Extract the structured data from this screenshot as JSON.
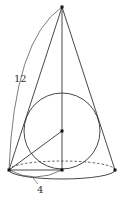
{
  "figure": {
    "labels": {
      "slant_height": "12",
      "base_radius": "4"
    },
    "colors": {
      "stroke": "#333333",
      "point": "#111111",
      "background": "#ffffff"
    }
  }
}
